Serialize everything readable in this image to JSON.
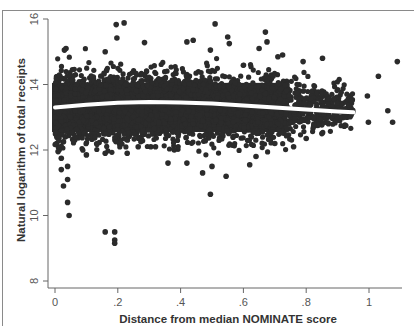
{
  "chart_data": {
    "type": "scatter",
    "title": "",
    "xlabel": "Distance from median NOMINATE score",
    "ylabel": "Natural logarithm of total receipts",
    "xlim": [
      0,
      1.1
    ],
    "ylim": [
      8,
      16
    ],
    "x_ticks": [
      0,
      0.2,
      0.4,
      0.6,
      0.8,
      1.0
    ],
    "x_tick_labels": [
      "0",
      ".2",
      ".4",
      ".6",
      ".8",
      "1"
    ],
    "y_ticks": [
      8,
      10,
      12,
      14,
      16
    ],
    "y_tick_labels": [
      "8",
      "10",
      "12",
      "14",
      "16"
    ],
    "grid": false,
    "legend": null,
    "dense_cloud": {
      "description": "Dense mass of several thousand points",
      "x_range": [
        0,
        0.95
      ],
      "y_center": 13.3,
      "y_core_range": [
        12.3,
        14.2
      ],
      "density_falloff_x": 0.75
    },
    "series": [
      {
        "name": "fit",
        "type": "line",
        "color": "#ffffff",
        "x": [
          0,
          0.1,
          0.2,
          0.3,
          0.4,
          0.5,
          0.6,
          0.7,
          0.8,
          0.9,
          0.95
        ],
        "y": [
          13.3,
          13.38,
          13.44,
          13.47,
          13.45,
          13.42,
          13.36,
          13.3,
          13.24,
          13.18,
          13.15
        ]
      },
      {
        "name": "outliers",
        "type": "scatter",
        "color": "#2b2b2b",
        "points": [
          [
            0.195,
            15.83
          ],
          [
            0.22,
            15.88
          ],
          [
            0.197,
            15.42
          ],
          [
            0.51,
            15.85
          ],
          [
            0.67,
            15.6
          ],
          [
            0.675,
            15.3
          ],
          [
            0.42,
            15.3
          ],
          [
            0.44,
            15.35
          ],
          [
            0.285,
            15.28
          ],
          [
            0.495,
            15.05
          ],
          [
            0.55,
            15.45
          ],
          [
            0.555,
            15.25
          ],
          [
            0.65,
            15.1
          ],
          [
            0.71,
            14.85
          ],
          [
            0.725,
            14.9
          ],
          [
            0.852,
            14.8
          ],
          [
            0.79,
            14.7
          ],
          [
            0.03,
            15.05
          ],
          [
            0.035,
            15.1
          ],
          [
            0.16,
            15.0
          ],
          [
            1.09,
            14.7
          ],
          [
            1.03,
            14.25
          ],
          [
            0.995,
            13.65
          ],
          [
            1.06,
            13.2
          ],
          [
            0.998,
            12.85
          ],
          [
            1.075,
            12.85
          ],
          [
            0.945,
            13.5
          ],
          [
            0.01,
            11.95
          ],
          [
            0.02,
            11.75
          ],
          [
            0.04,
            11.5
          ],
          [
            0.02,
            11.4
          ],
          [
            0.04,
            11.1
          ],
          [
            0.027,
            10.9
          ],
          [
            0.04,
            10.4
          ],
          [
            0.045,
            10.0
          ],
          [
            0.16,
            9.5
          ],
          [
            0.19,
            9.5
          ],
          [
            0.19,
            9.25
          ],
          [
            0.19,
            9.15
          ],
          [
            0.16,
            11.9
          ],
          [
            0.265,
            12.1
          ],
          [
            0.305,
            12.1
          ],
          [
            0.32,
            12.1
          ],
          [
            0.36,
            11.6
          ],
          [
            0.42,
            11.6
          ],
          [
            0.47,
            11.3
          ],
          [
            0.5,
            11.5
          ],
          [
            0.545,
            11.2
          ],
          [
            0.62,
            11.55
          ],
          [
            0.64,
            11.8
          ],
          [
            0.495,
            10.65
          ],
          [
            0.23,
            11.9
          ],
          [
            0.1,
            11.85
          ],
          [
            0.38,
            12.0
          ],
          [
            0.7,
            12.2
          ],
          [
            0.76,
            12.1
          ],
          [
            0.8,
            12.35
          ],
          [
            0.85,
            12.5
          ]
        ]
      }
    ]
  },
  "layout": {
    "plot": {
      "x0": 55,
      "x1": 369,
      "y_at_8": 281,
      "y_at_16": 19,
      "axis_x_end": 402,
      "axis_y_top": 19
    },
    "colors": {
      "dot": "#2b2b2b",
      "axis": "#666666",
      "fit": "#ffffff"
    }
  }
}
